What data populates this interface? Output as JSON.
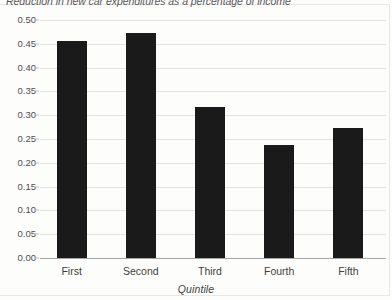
{
  "chart_data": {
    "type": "bar",
    "title": "Reduction in new car expenditures as a percentage of income",
    "xlabel": "Quintile",
    "ylabel": "",
    "categories": [
      "First",
      "Second",
      "Third",
      "Fourth",
      "Fifth"
    ],
    "values": [
      0.455,
      0.473,
      0.318,
      0.237,
      0.273
    ],
    "ylim": [
      0.0,
      0.5
    ],
    "ytick_step": 0.05,
    "ytick_labels": [
      "0.00",
      "0.05",
      "0.10",
      "0.15",
      "0.20",
      "0.25",
      "0.30",
      "0.35",
      "0.40",
      "0.45",
      "0.50"
    ],
    "grid": true,
    "legend": false,
    "bar_color": "#1a1a1a",
    "gridline_color": "#e3e3e1",
    "axis_color": "#a6a6a4",
    "background_color": "#fdfdfb"
  }
}
